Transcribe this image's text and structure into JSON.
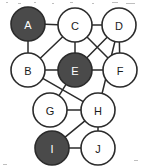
{
  "figure": {
    "background": "#ffffff",
    "width": 145,
    "height": 168
  },
  "style": {
    "edge_color": "#2b2b2b",
    "node_outline": "#2b2b2b",
    "node_fill_light": "#ffffff",
    "node_fill_dark": "#4a4a4a",
    "label_on_light": "#1a1a1a",
    "label_on_dark": "#ffffff",
    "node_radius": 17
  },
  "chart_data": {
    "type": "diagram",
    "subtype": "node-link-graph",
    "title": "",
    "directed": false,
    "node_count": 10,
    "edge_count": 17,
    "nodes": [
      {
        "id": "A",
        "label": "A",
        "x": 28,
        "y": 24,
        "r": 17,
        "shade": "dark",
        "fill": "#4a4a4a",
        "label_color": "#ffffff"
      },
      {
        "id": "C",
        "label": "C",
        "x": 75,
        "y": 25,
        "r": 17,
        "shade": "light",
        "fill": "#ffffff",
        "label_color": "#1a1a1a"
      },
      {
        "id": "D",
        "label": "D",
        "x": 119,
        "y": 25,
        "r": 17,
        "shade": "light",
        "fill": "#ffffff",
        "label_color": "#1a1a1a"
      },
      {
        "id": "B",
        "label": "B",
        "x": 28,
        "y": 70,
        "r": 17,
        "shade": "light",
        "fill": "#ffffff",
        "label_color": "#1a1a1a"
      },
      {
        "id": "E",
        "label": "E",
        "x": 75,
        "y": 70,
        "r": 17,
        "shade": "dark",
        "fill": "#4a4a4a",
        "label_color": "#ffffff"
      },
      {
        "id": "F",
        "label": "F",
        "x": 120,
        "y": 70,
        "r": 17,
        "shade": "light",
        "fill": "#ffffff",
        "label_color": "#1a1a1a"
      },
      {
        "id": "G",
        "label": "G",
        "x": 50,
        "y": 110,
        "r": 17,
        "shade": "light",
        "fill": "#ffffff",
        "label_color": "#1a1a1a"
      },
      {
        "id": "H",
        "label": "H",
        "x": 98,
        "y": 110,
        "r": 17,
        "shade": "light",
        "fill": "#ffffff",
        "label_color": "#1a1a1a"
      },
      {
        "id": "I",
        "label": "I",
        "x": 52,
        "y": 148,
        "r": 17,
        "shade": "dark",
        "fill": "#4a4a4a",
        "label_color": "#ffffff"
      },
      {
        "id": "J",
        "label": "J",
        "x": 98,
        "y": 148,
        "r": 17,
        "shade": "light",
        "fill": "#ffffff",
        "label_color": "#1a1a1a"
      }
    ],
    "edges": [
      {
        "source": "A",
        "target": "C"
      },
      {
        "source": "A",
        "target": "B"
      },
      {
        "source": "B",
        "target": "C"
      },
      {
        "source": "C",
        "target": "D"
      },
      {
        "source": "C",
        "target": "E"
      },
      {
        "source": "C",
        "target": "F"
      },
      {
        "source": "D",
        "target": "E"
      },
      {
        "source": "D",
        "target": "F"
      },
      {
        "source": "D",
        "target": "H"
      },
      {
        "source": "B",
        "target": "E"
      },
      {
        "source": "E",
        "target": "F"
      },
      {
        "source": "E",
        "target": "G"
      },
      {
        "source": "B",
        "target": "H"
      },
      {
        "source": "G",
        "target": "H"
      },
      {
        "source": "H",
        "target": "I"
      },
      {
        "source": "H",
        "target": "J"
      },
      {
        "source": "I",
        "target": "J"
      }
    ],
    "highlighted_nodes": [
      "A",
      "E",
      "I"
    ],
    "legend": [],
    "annotations": []
  }
}
